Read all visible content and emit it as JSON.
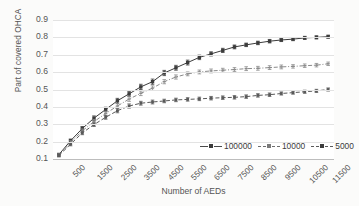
{
  "chart_data": {
    "type": "line",
    "title": "",
    "xlabel": "Number of AEDs",
    "ylabel": "Part of covered OHCA",
    "x": [
      500,
      1000,
      1500,
      2000,
      2500,
      3000,
      3500,
      4000,
      4500,
      5000,
      5500,
      6000,
      6500,
      7000,
      7500,
      8000,
      8500,
      9000,
      9500,
      10000,
      10500,
      11000,
      11500,
      12000
    ],
    "xtick_labels": [
      "500",
      "1500",
      "2500",
      "3500",
      "4500",
      "5500",
      "6500",
      "7500",
      "8500",
      "9500",
      "10500",
      "11500"
    ],
    "xtick_values": [
      500,
      1500,
      2500,
      3500,
      4500,
      5500,
      6500,
      7500,
      8500,
      9500,
      10500,
      11500
    ],
    "ytick_labels": [
      "0.1",
      "0.2",
      "0.3",
      "0.4",
      "0.5",
      "0.6",
      "0.7",
      "0.8",
      "0.9"
    ],
    "ytick_values": [
      0.1,
      0.2,
      0.3,
      0.4,
      0.5,
      0.6,
      0.7,
      0.8,
      0.9
    ],
    "ylim": [
      0.1,
      0.9
    ],
    "xlim": [
      250,
      12250
    ],
    "grid": "horizontal",
    "legend_position": "inside bottom-right",
    "has_error_bars": true,
    "series": [
      {
        "name": "100000",
        "color": "#3c3c3c",
        "line_style": "solid",
        "marker": "square-filled",
        "values": [
          0.125,
          0.205,
          0.275,
          0.335,
          0.385,
          0.435,
          0.475,
          0.515,
          0.545,
          0.595,
          0.625,
          0.655,
          0.685,
          0.705,
          0.725,
          0.745,
          0.757,
          0.768,
          0.778,
          0.785,
          0.79,
          0.797,
          0.8,
          0.804
        ],
        "errors": [
          0.008,
          0.01,
          0.012,
          0.013,
          0.013,
          0.014,
          0.014,
          0.015,
          0.015,
          0.015,
          0.014,
          0.014,
          0.013,
          0.012,
          0.012,
          0.011,
          0.01,
          0.01,
          0.01,
          0.009,
          0.009,
          0.009,
          0.009,
          0.009
        ]
      },
      {
        "name": "10000",
        "color": "#8a8a8a",
        "line_style": "dash-dot",
        "marker": "dash-open",
        "values": [
          0.122,
          0.195,
          0.262,
          0.315,
          0.362,
          0.405,
          0.445,
          0.478,
          0.508,
          0.545,
          0.572,
          0.59,
          0.601,
          0.607,
          0.611,
          0.615,
          0.62,
          0.622,
          0.626,
          0.63,
          0.633,
          0.637,
          0.64,
          0.648
        ],
        "errors": [
          0.008,
          0.01,
          0.011,
          0.012,
          0.013,
          0.013,
          0.013,
          0.013,
          0.013,
          0.012,
          0.012,
          0.011,
          0.011,
          0.011,
          0.011,
          0.011,
          0.011,
          0.011,
          0.011,
          0.011,
          0.01,
          0.01,
          0.01,
          0.01
        ]
      },
      {
        "name": "5000",
        "color": "#5a5a5a",
        "line_style": "dashed",
        "marker": "square-small",
        "values": [
          0.12,
          0.185,
          0.25,
          0.298,
          0.34,
          0.378,
          0.405,
          0.421,
          0.428,
          0.434,
          0.44,
          0.443,
          0.446,
          0.45,
          0.453,
          0.455,
          0.459,
          0.466,
          0.47,
          0.477,
          0.482,
          0.487,
          0.492,
          0.5
        ],
        "errors": [
          0.008,
          0.009,
          0.01,
          0.011,
          0.011,
          0.012,
          0.012,
          0.011,
          0.011,
          0.01,
          0.01,
          0.01,
          0.01,
          0.01,
          0.01,
          0.01,
          0.01,
          0.01,
          0.01,
          0.009,
          0.009,
          0.009,
          0.009,
          0.009
        ]
      }
    ],
    "legend": [
      {
        "label": "100000"
      },
      {
        "label": "10000"
      },
      {
        "label": "5000"
      }
    ]
  }
}
